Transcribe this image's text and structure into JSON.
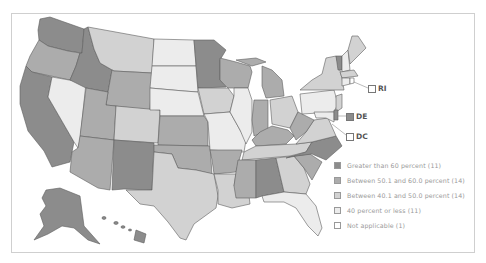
{
  "map": {
    "colors": {
      "cat1": "#8c8c8c",
      "cat2": "#acacac",
      "cat3": "#d2d2d2",
      "cat4": "#ececec",
      "cat5": "#ffffff",
      "border": "#5e5e5e"
    },
    "callouts": [
      {
        "id": "RI",
        "label": "RI",
        "category": "cat5"
      },
      {
        "id": "DE",
        "label": "DE",
        "category": "cat1"
      },
      {
        "id": "DC",
        "label": "DC",
        "category": "cat5"
      }
    ]
  },
  "legend": {
    "items": [
      {
        "label": "Greater than 60 percent (11)",
        "category": "cat1"
      },
      {
        "label": "Between 50.1 and 60.0 percent (14)",
        "category": "cat2"
      },
      {
        "label": "Between 40.1 and 50.0 percent (14)",
        "category": "cat3"
      },
      {
        "label": "40 percent or less (11)",
        "category": "cat4"
      },
      {
        "label": "Not applicable (1)",
        "category": "cat5"
      }
    ]
  }
}
